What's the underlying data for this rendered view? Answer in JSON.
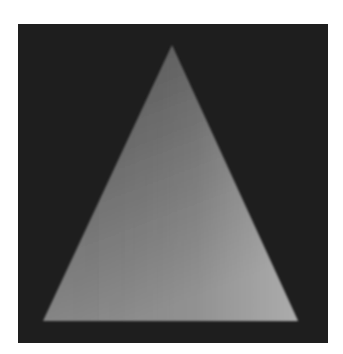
{
  "image": {
    "description": "Grayscale rendering of a shaded triangle on a dark square background",
    "background_color": "#ffffff",
    "panel_color": "#1e1e1e",
    "shape": {
      "type": "triangle",
      "apex": [
        172,
        45
      ],
      "bottom_left": [
        43,
        321
      ],
      "bottom_right": [
        298,
        321
      ],
      "gradient": {
        "top_color": "#555555",
        "bottom_left_color": "#8a8a8a",
        "bottom_right_color": "#b4b4b4"
      }
    }
  }
}
